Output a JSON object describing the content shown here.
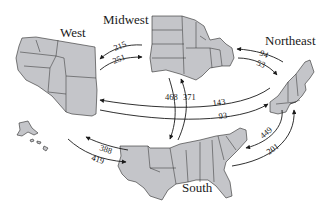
{
  "diagram": {
    "regions": {
      "west": "West",
      "midwest": "Midwest",
      "northeast": "Northeast",
      "south": "South"
    },
    "flows": [
      {
        "from": "Midwest",
        "to": "West",
        "value": "215"
      },
      {
        "from": "West",
        "to": "Midwest",
        "value": "251"
      },
      {
        "from": "Northeast",
        "to": "Midwest",
        "value": "94"
      },
      {
        "from": "Midwest",
        "to": "Northeast",
        "value": "53"
      },
      {
        "from": "Midwest",
        "to": "South",
        "value": "468"
      },
      {
        "from": "South",
        "to": "Midwest",
        "value": "371"
      },
      {
        "from": "Northeast",
        "to": "West",
        "value": "143"
      },
      {
        "from": "West",
        "to": "Northeast",
        "value": "93"
      },
      {
        "from": "South",
        "to": "West",
        "value": "388"
      },
      {
        "from": "West",
        "to": "South",
        "value": "419"
      },
      {
        "from": "Northeast",
        "to": "South",
        "value": "449"
      },
      {
        "from": "South",
        "to": "Northeast",
        "value": "201"
      }
    ],
    "colors": {
      "map_fill": "#c4c5c9",
      "outline": "#2a2a2a",
      "arrow": "#1a1a1a",
      "background": "#ffffff"
    }
  }
}
